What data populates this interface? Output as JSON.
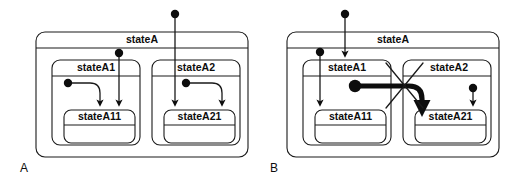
{
  "figure": {
    "width": 518,
    "height": 186,
    "background_color": "#ffffff",
    "line_color": "#1a1a1a",
    "text_color": "#0d0d0d"
  },
  "panels": [
    {
      "id": "A",
      "label": "A",
      "description": "Valid transitions entering substates of stateA",
      "states": {
        "outer": {
          "name": "stateA"
        },
        "region_left": {
          "name": "stateA1"
        },
        "region_left_sub": {
          "name": "stateA11"
        },
        "region_right": {
          "name": "stateA2"
        },
        "region_right_sub": {
          "name": "stateA21"
        }
      },
      "transitions": [
        {
          "id": "a-external-to-stateA21",
          "kind": "initial-to-deep-substate",
          "valid": true
        },
        {
          "id": "a-statea-initial-to-stateA11",
          "kind": "initial-to-substate",
          "valid": true
        },
        {
          "id": "a-stateA1-initial-to-stateA11",
          "kind": "region-initial",
          "valid": true
        },
        {
          "id": "a-stateA2-initial-to-stateA21",
          "kind": "region-initial",
          "valid": true
        }
      ]
    },
    {
      "id": "B",
      "label": "B",
      "description": "Illegal transition crossing between orthogonal regions, marked with an X",
      "states": {
        "outer": {
          "name": "stateA"
        },
        "region_left": {
          "name": "stateA1"
        },
        "region_left_sub": {
          "name": "stateA11"
        },
        "region_right": {
          "name": "stateA2"
        },
        "region_right_sub": {
          "name": "stateA21"
        }
      },
      "transitions": [
        {
          "id": "b-external-to-stateA1",
          "kind": "initial-to-substate",
          "valid": true
        },
        {
          "id": "b-statea-initial-to-stateA11",
          "kind": "initial-to-substate",
          "valid": true
        },
        {
          "id": "b-stateA2-initial-to-stateA21",
          "kind": "region-initial",
          "valid": true
        },
        {
          "id": "b-illegal-cross-region",
          "kind": "cross-region",
          "valid": false,
          "marker": "x-cross"
        }
      ]
    }
  ]
}
